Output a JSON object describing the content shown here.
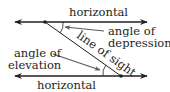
{
  "diagram": {
    "type": "angle of elevation and depression",
    "labels": {
      "top_horizontal": "horizontal",
      "bottom_horizontal": "horizontal",
      "line_of_sight": "line of sight",
      "depression_line1": "angle of",
      "depression_line2": "depression",
      "elevation_line1": "angle of",
      "elevation_line2": "elevation"
    },
    "colors": {
      "line": "#231f20",
      "text": "#231f20",
      "pointer": "#5a5a5a"
    }
  }
}
